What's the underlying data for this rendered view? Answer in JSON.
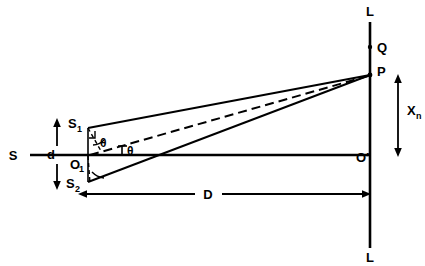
{
  "figure": {
    "background_color": "#ffffff",
    "line_color": "#000000",
    "width": 425,
    "height": 266
  },
  "labels": {
    "source": "S",
    "slit_upper": "S",
    "slit_upper_sub": "1",
    "slit_lower": "S",
    "slit_lower_sub": "2",
    "slit_midpoint": "O",
    "slit_midpoint_sub": "1",
    "slit_separation": "d",
    "angle_at_slit": "θ",
    "angle_at_axis": "θ",
    "screen_top": "L",
    "screen_bottom": "L",
    "point_q": "Q",
    "point_p": "P",
    "screen_center": "O′",
    "fringe_distance": "X",
    "fringe_distance_sub": "n",
    "screen_distance": "D"
  },
  "geometry": {
    "axis_y": 155,
    "screen_x": 370,
    "screen_top_y": 22,
    "screen_bottom_y": 248,
    "source_x": 22,
    "axis_start_x": 30,
    "slit_plane_x": 88,
    "slit_upper_y": 128,
    "slit_lower_y": 182,
    "point_p_y": 75,
    "point_q_y": 47,
    "dim_d_x": 57,
    "dim_xn_x": 398,
    "dim_d_line_top_y": 122,
    "dim_d_line_bottom_y": 188,
    "dim_D_y": 194,
    "dim_D_left_x": 78,
    "dim_D_right_x": 370
  },
  "elements": {
    "ray_s1_p": "ray from upper slit S1 to point P",
    "ray_s2_p": "ray from lower slit S2 to point P",
    "ray_o1_p": "dashed central ray from slit midpoint O1 to point P",
    "optical_axis": "horizontal optical axis from S through O1 to O′",
    "screen": "vertical screen line L-L",
    "path_difference_marker": "short dashed perpendicular from S1 to the S2-P ray"
  }
}
